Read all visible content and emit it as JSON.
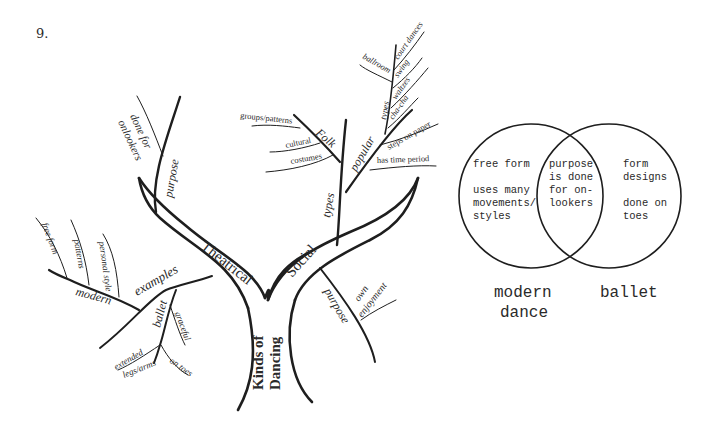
{
  "problem_number": "9.",
  "tree": {
    "trunk_label_line1": "Kinds of",
    "trunk_label_line2": "Dancing",
    "theatrical": {
      "label": "Theatrical",
      "purpose": {
        "label": "purpose",
        "detail_line1": "done for",
        "detail_line2": "onlookers"
      },
      "examples": {
        "label": "examples",
        "modern": {
          "label": "modern",
          "items": [
            "free form",
            "patterns",
            "personal style"
          ]
        },
        "ballet": {
          "label": "ballet",
          "items": [
            "graceful",
            "on toes"
          ],
          "extended_line1": "extended",
          "extended_line2": "legs/arms"
        }
      }
    },
    "social": {
      "label": "Social",
      "purpose": {
        "label": "purpose",
        "detail_line1": "own",
        "detail_line2": "enjoyment"
      },
      "types": {
        "label": "types",
        "folk": {
          "label": "Folk",
          "items": [
            "groups/patterns",
            "cultural",
            "costumes"
          ]
        },
        "popular": {
          "label": "popular",
          "items": [
            "steps on paper",
            "has time period"
          ],
          "types": {
            "label": "types",
            "items": [
              "ballroom",
              "court dances",
              "swing",
              "waltzes",
              "cha-cha"
            ]
          }
        }
      }
    }
  },
  "venn": {
    "left_only": [
      "free form",
      "",
      "uses many",
      "movements/",
      "styles"
    ],
    "overlap": [
      "purpose",
      "is done",
      "for on-",
      "lookers"
    ],
    "right_only": [
      "form",
      "designs",
      "",
      "done on",
      "toes"
    ],
    "left_label_line1": "modern",
    "left_label_line2": "dance",
    "right_label": "ballet"
  }
}
